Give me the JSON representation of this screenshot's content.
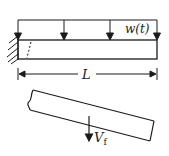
{
  "diagram": {
    "load_label": "w(t)",
    "length_label": "L",
    "shear_label_main": "V",
    "shear_label_sub": "f",
    "colors": {
      "stroke": "#1a1a1a",
      "background": "#ffffff"
    },
    "load_arrow_count": 4
  }
}
